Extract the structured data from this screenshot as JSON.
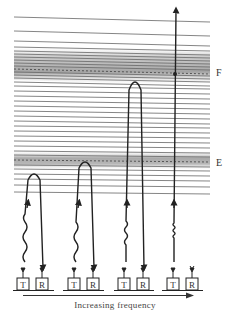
{
  "diagram": {
    "layer_labels": {
      "upper": "F",
      "lower": "E"
    },
    "station_labels": {
      "transmitter": "T",
      "receiver": "R"
    },
    "caption": "Increasing frequency",
    "stations": [
      {
        "id": 1,
        "transmitter": "T",
        "receiver": "R",
        "reflects_at": "below E",
        "wave": "long wavelength"
      },
      {
        "id": 2,
        "transmitter": "T",
        "receiver": "R",
        "reflects_at": "E",
        "wave": "medium wavelength"
      },
      {
        "id": 3,
        "transmitter": "T",
        "receiver": "R",
        "reflects_at": "F",
        "wave": "short wavelength"
      },
      {
        "id": 4,
        "transmitter": "T",
        "receiver": "R",
        "reflects_at": "none (escapes)",
        "wave": "shortest wavelength"
      }
    ],
    "colors": {
      "ink": "#222222",
      "line": "#555555",
      "band_shade": "#9a9a9a"
    }
  }
}
